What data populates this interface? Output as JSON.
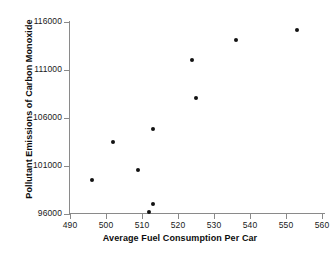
{
  "chart_data": {
    "type": "scatter",
    "title": "",
    "xlabel": "Average Fuel Consumption Per Car",
    "ylabel": "Pollutant Emissions of Carbon Monoxide",
    "xlim": [
      487,
      560
    ],
    "ylim": [
      95000,
      116000
    ],
    "xticks": [
      490,
      500,
      510,
      520,
      530,
      540,
      550,
      560
    ],
    "xtick_labels": [
      "490",
      "500",
      "510",
      "520",
      "530",
      "540",
      "550",
      "560"
    ],
    "yticks": [
      96000,
      101000,
      106000,
      111000,
      116000
    ],
    "ytick_labels": [
      "96000",
      "101000",
      "106000",
      "111000",
      "116000"
    ],
    "grid": false,
    "legend": null,
    "marker": "filled-circle",
    "marker_color": "#121212",
    "axis_color": "#8a8a8a",
    "points": [
      {
        "x": 496,
        "y": 99500
      },
      {
        "x": 502,
        "y": 103500
      },
      {
        "x": 509,
        "y": 100600
      },
      {
        "x": 512,
        "y": 96200
      },
      {
        "x": 513,
        "y": 97050
      },
      {
        "x": 513,
        "y": 104850
      },
      {
        "x": 524,
        "y": 112050
      },
      {
        "x": 525,
        "y": 108100
      },
      {
        "x": 536,
        "y": 114100
      },
      {
        "x": 553,
        "y": 115150
      }
    ]
  }
}
